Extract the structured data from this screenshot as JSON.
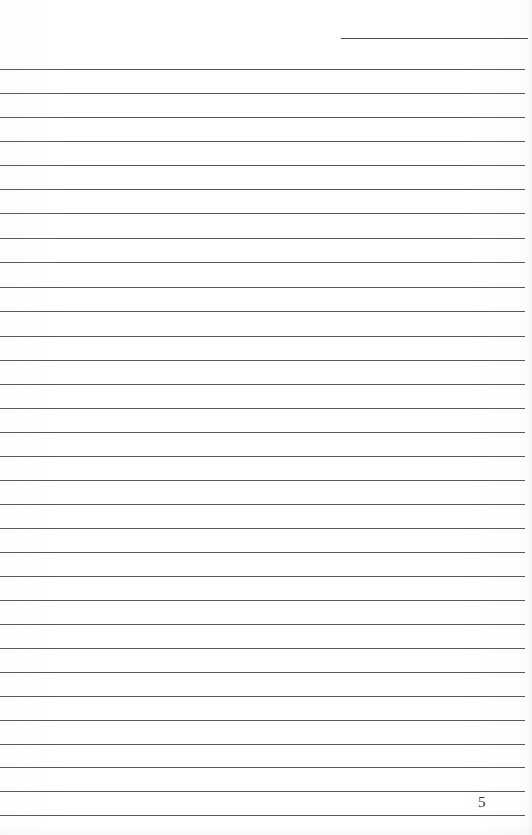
{
  "document": {
    "type": "blank-lined-answer-page",
    "page_number": "5",
    "page_width": 532,
    "page_height": 835,
    "background_color": "#fefefe",
    "rule_color": "#3c3c3c",
    "page_number_color": "#2e2e2e",
    "written_content": "",
    "header_rule": {
      "name": "name-date-header-rule",
      "x": 341,
      "y": 38,
      "width": 187
    },
    "rules": [
      {
        "y": 69
      },
      {
        "y": 93
      },
      {
        "y": 117
      },
      {
        "y": 141
      },
      {
        "y": 165
      },
      {
        "y": 189
      },
      {
        "y": 213
      },
      {
        "y": 238
      },
      {
        "y": 262
      },
      {
        "y": 287
      },
      {
        "y": 311
      },
      {
        "y": 336
      },
      {
        "y": 360
      },
      {
        "y": 384
      },
      {
        "y": 408
      },
      {
        "y": 432
      },
      {
        "y": 456
      },
      {
        "y": 480
      },
      {
        "y": 504
      },
      {
        "y": 528
      },
      {
        "y": 552
      },
      {
        "y": 576
      },
      {
        "y": 600
      },
      {
        "y": 624
      },
      {
        "y": 648
      },
      {
        "y": 672
      },
      {
        "y": 696
      },
      {
        "y": 720
      },
      {
        "y": 744
      },
      {
        "y": 767
      },
      {
        "y": 791
      },
      {
        "y": 815
      }
    ],
    "page_number_position": {
      "x": 478,
      "y": 795
    }
  }
}
